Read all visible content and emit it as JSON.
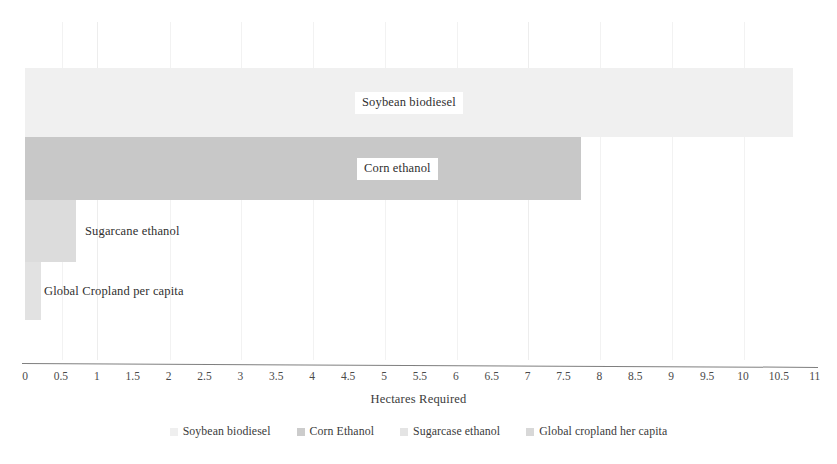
{
  "chart_data": {
    "type": "bar",
    "orientation": "horizontal",
    "title": "",
    "xlabel": "Hectares Required",
    "ylabel": "",
    "xlim": [
      0,
      11
    ],
    "grid": true,
    "legend_position": "bottom",
    "categories": [
      "Soybean biodiesel",
      "Corn ethanol",
      "Sugarcane ethanol",
      "Global Cropland per capita"
    ],
    "values": [
      10.7,
      7.75,
      0.71,
      0.22
    ],
    "tick_labels": [
      "0",
      "0.5",
      "1",
      "1.5",
      "2",
      "2.5",
      "3",
      "3.5",
      "4",
      "4.5",
      "5",
      "5.5",
      "6",
      "6.5",
      "7",
      "7.5",
      "8",
      "8.5",
      "9",
      "9.5",
      "10",
      "10.5",
      "11"
    ],
    "tick_values": [
      0,
      0.5,
      1,
      1.5,
      2,
      2.5,
      3,
      3.5,
      4,
      4.5,
      5,
      5.5,
      6,
      6.5,
      7,
      7.5,
      8,
      8.5,
      9,
      9.5,
      10,
      10.5,
      11
    ],
    "bars": [
      {
        "label": "Soybean biodiesel",
        "value": 10.7,
        "color": "#f0f0f0",
        "label_placement": "inside",
        "label_left_px": 355,
        "top_px": 68,
        "height_px": 69
      },
      {
        "label": "Corn ethanol",
        "value": 7.75,
        "color": "#c8c8c8",
        "label_placement": "inside",
        "label_left_px": 357,
        "top_px": 137,
        "height_px": 63
      },
      {
        "label": "Sugarcane ethanol",
        "value": 0.71,
        "color": "#dcdcdc",
        "label_placement": "outside",
        "label_left_px": 85,
        "top_px": 200,
        "height_px": 62
      },
      {
        "label": "Global Cropland per capita",
        "value": 0.22,
        "color": "#e2e2e2",
        "label_placement": "outside",
        "label_left_px": 44,
        "top_px": 262,
        "height_px": 58
      }
    ],
    "gridlines": [
      {
        "x_px": 62,
        "major": false
      },
      {
        "x_px": 97,
        "major": true
      },
      {
        "x_px": 170,
        "major": false
      },
      {
        "x_px": 241,
        "major": false
      },
      {
        "x_px": 313,
        "major": false
      },
      {
        "x_px": 385,
        "major": false
      },
      {
        "x_px": 457,
        "major": false
      },
      {
        "x_px": 528,
        "major": true
      },
      {
        "x_px": 600,
        "major": false
      },
      {
        "x_px": 672,
        "major": false
      },
      {
        "x_px": 744,
        "major": false
      }
    ],
    "legend": [
      {
        "label": "Soybean biodiesel",
        "color": "#efefef"
      },
      {
        "label": "Corn Ethanol",
        "color": "#cccccc"
      },
      {
        "label": "Sugarcase ethanol",
        "color": "#e4e4e4"
      },
      {
        "label": "Global cropland her capita",
        "color": "#d8d8d8"
      }
    ]
  },
  "axis": {
    "origin_px": 25,
    "px_per_unit": 71.8
  }
}
